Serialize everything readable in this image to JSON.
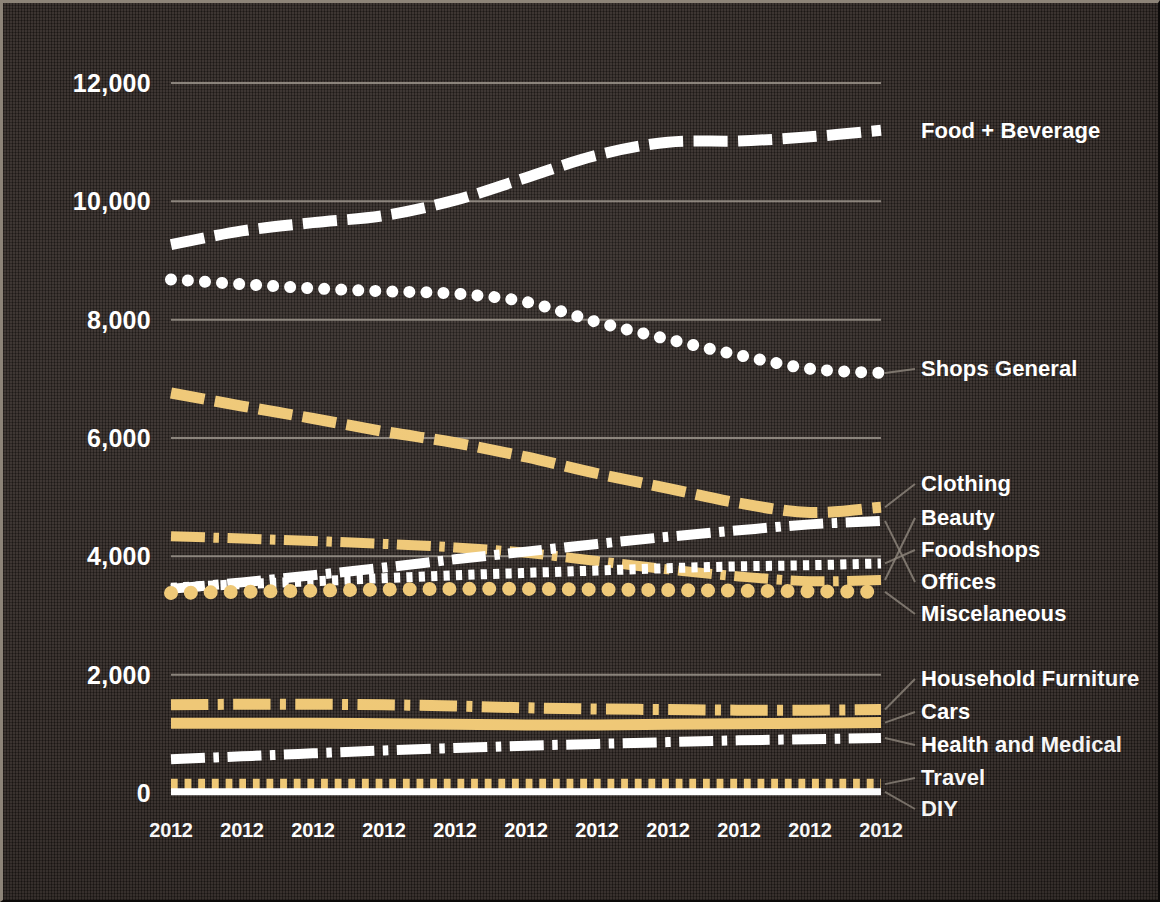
{
  "chart_data": {
    "type": "line",
    "title": "",
    "subtitle": "",
    "xlabel": "",
    "ylabel": "",
    "grid": true,
    "legend_position": "right-inline-labels",
    "background_color": "#2e2622",
    "colors": {
      "white": "#ffffff",
      "gold": "#efc876",
      "gridline": "#9a938a",
      "leader_line": "#8e867c",
      "text": "#ffffff"
    },
    "x": [
      "2012",
      "2012",
      "2012",
      "2012",
      "2012",
      "2012",
      "2012",
      "2012",
      "2012",
      "2012",
      "2012"
    ],
    "xlim": [
      0,
      10
    ],
    "ylim": [
      0,
      12000
    ],
    "yticks": [
      0,
      2000,
      4000,
      6000,
      8000,
      10000,
      12000
    ],
    "ytick_labels": [
      "0",
      "2,000",
      "4,000",
      "6,000",
      "8,000",
      "10,000",
      "12,000"
    ],
    "series": [
      {
        "name": "Food + Beverage",
        "color": "#ffffff",
        "style": "dashed",
        "width": 11,
        "values": [
          9270,
          9500,
          9640,
          9760,
          10020,
          10400,
          10780,
          11000,
          11020,
          11090,
          11200
        ]
      },
      {
        "name": "Shops General",
        "color": "#ffffff",
        "style": "dotted-round",
        "width": 12,
        "values": [
          8680,
          8600,
          8530,
          8480,
          8440,
          8300,
          7960,
          7670,
          7400,
          7170,
          7100
        ]
      },
      {
        "name": "Clothing",
        "color": "#efc876",
        "style": "dashed",
        "width": 11,
        "values": [
          6760,
          6540,
          6330,
          6110,
          5920,
          5680,
          5400,
          5150,
          4900,
          4740,
          4830
        ]
      },
      {
        "name": "Beauty",
        "color": "#efc876",
        "style": "dash-dot",
        "width": 10,
        "values": [
          4340,
          4300,
          4260,
          4210,
          4150,
          4060,
          3920,
          3780,
          3660,
          3580,
          3600
        ]
      },
      {
        "name": "Foodshops",
        "color": "#ffffff",
        "style": "dotted-square",
        "width": 10,
        "values": [
          3470,
          3530,
          3580,
          3630,
          3680,
          3720,
          3760,
          3800,
          3830,
          3850,
          3880
        ]
      },
      {
        "name": "Offices",
        "color": "#ffffff",
        "style": "dash-dot",
        "width": 10,
        "values": [
          3450,
          3560,
          3680,
          3810,
          3950,
          4080,
          4210,
          4330,
          4440,
          4540,
          4600
        ]
      },
      {
        "name": "Miscelaneous",
        "color": "#efc876",
        "style": "dotted-round",
        "width": 14,
        "values": [
          3380,
          3400,
          3420,
          3440,
          3450,
          3450,
          3440,
          3430,
          3420,
          3410,
          3400
        ]
      },
      {
        "name": "Household Furniture",
        "color": "#efc876",
        "style": "dash-dot",
        "width": 11,
        "values": [
          1490,
          1500,
          1500,
          1490,
          1470,
          1440,
          1420,
          1410,
          1400,
          1400,
          1410
        ]
      },
      {
        "name": "Cars",
        "color": "#efc876",
        "style": "solid",
        "width": 11,
        "values": [
          1180,
          1180,
          1180,
          1170,
          1160,
          1150,
          1150,
          1160,
          1170,
          1180,
          1190
        ]
      },
      {
        "name": "Health and Medical",
        "color": "#ffffff",
        "style": "dash-dot",
        "width": 10,
        "values": [
          570,
          620,
          670,
          720,
          760,
          800,
          830,
          860,
          890,
          910,
          930
        ]
      },
      {
        "name": "Travel",
        "color": "#efc876",
        "style": "dotted-square",
        "width": 11,
        "values": [
          150,
          150,
          150,
          150,
          150,
          150,
          150,
          150,
          150,
          150,
          150
        ]
      },
      {
        "name": "DIY",
        "color": "#ffffff",
        "style": "solid",
        "width": 7,
        "values": [
          20,
          20,
          20,
          20,
          20,
          20,
          20,
          20,
          20,
          20,
          20
        ]
      }
    ],
    "series_labels": [
      {
        "name": "Food + Beverage",
        "y_px": 128
      },
      {
        "name": "Shops General",
        "y_px": 366
      },
      {
        "name": "Clothing",
        "y_px": 481
      },
      {
        "name": "Beauty",
        "y_px": 515
      },
      {
        "name": "Foodshops",
        "y_px": 547
      },
      {
        "name": "Offices",
        "y_px": 579
      },
      {
        "name": "Miscelaneous",
        "y_px": 611
      },
      {
        "name": "Household Furniture",
        "y_px": 676
      },
      {
        "name": "Cars",
        "y_px": 709
      },
      {
        "name": "Health and Medical",
        "y_px": 742
      },
      {
        "name": "Travel",
        "y_px": 775
      },
      {
        "name": "DIY",
        "y_px": 806
      }
    ]
  }
}
